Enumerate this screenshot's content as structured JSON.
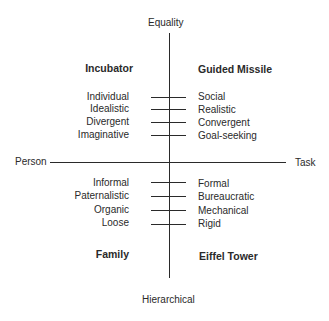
{
  "axes": {
    "top": "Equality",
    "bottom": "Hierarchical",
    "left": "Person",
    "right": "Task"
  },
  "quadrants": {
    "top_left": "Incubator",
    "top_right": "Guided Missile",
    "bottom_left": "Family",
    "bottom_right": "Eiffel Tower"
  },
  "upper_pairs": [
    {
      "left": "Individual",
      "right": "Social"
    },
    {
      "left": "Idealistic",
      "right": "Realistic"
    },
    {
      "left": "Divergent",
      "right": "Convergent"
    },
    {
      "left": "Imaginative",
      "right": "Goal-seeking"
    }
  ],
  "lower_pairs": [
    {
      "left": "Informal",
      "right": "Formal"
    },
    {
      "left": "Paternalistic",
      "right": "Bureaucratic"
    },
    {
      "left": "Organic",
      "right": "Mechanical"
    },
    {
      "left": "Loose",
      "right": "Rigid"
    }
  ]
}
